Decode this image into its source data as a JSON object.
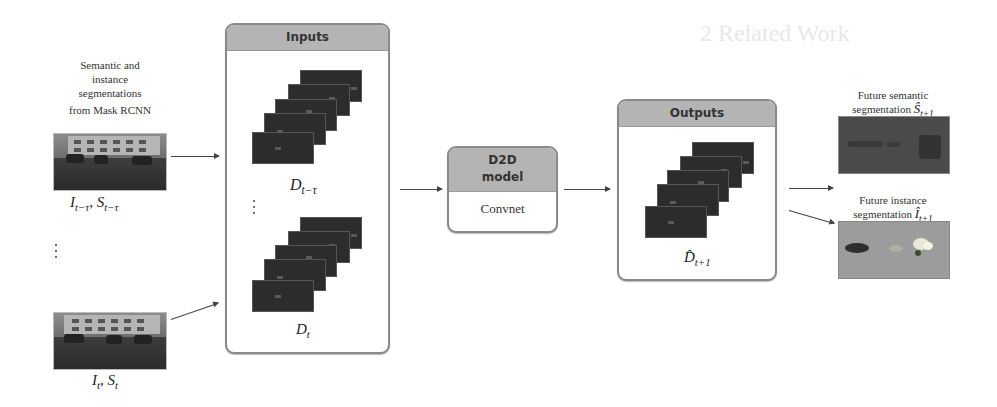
{
  "diagram": {
    "left": {
      "source_caption": [
        "Semantic and",
        "instance",
        "segmentations",
        "from Mask RCNN"
      ],
      "frame_top_label": "I_{t−τ}, S_{t−τ}",
      "frame_top_label_parts": {
        "I": "I",
        "I_sub": "t−τ",
        "sep": ", ",
        "S": "S",
        "S_sub": "t−τ"
      },
      "frame_bottom_label_parts": {
        "I": "I",
        "I_sub": "t",
        "sep": ", ",
        "S": "S",
        "S_sub": "t"
      },
      "ellipsis": "⋮"
    },
    "inputs": {
      "title": "Inputs",
      "stack_top_label": {
        "base": "D",
        "sub": "t−τ"
      },
      "stack_bottom_label": {
        "base": "D",
        "sub": "t"
      },
      "ellipsis": "⋮"
    },
    "model": {
      "title_line1": "D2D",
      "title_line2": "model",
      "body": "Convnet"
    },
    "outputs": {
      "title": "Outputs",
      "stack_label": {
        "base": "D̂",
        "sub": "t+1"
      }
    },
    "results": {
      "semantic": {
        "caption_line1": "Future semantic",
        "caption_line2": "segmentation",
        "symbol": "Ŝ",
        "sub": "t+1"
      },
      "instance": {
        "caption_line1": "Future instance",
        "caption_line2": "segmentation",
        "symbol": "Î",
        "sub": "t+1"
      }
    },
    "colors": {
      "header_fill": "#b4b4b4",
      "panel_border": "#8a8a8a",
      "frame_fill": "#2c2c2c",
      "semantic_fill": "#4a4a4a",
      "instance_fill": "#9c9c9c",
      "arrow": "#444444"
    }
  },
  "background_page": {
    "section_heading": "2 Related Work"
  }
}
